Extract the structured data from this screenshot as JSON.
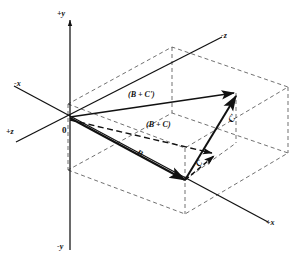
{
  "figure": {
    "background_color": "#ffffff",
    "stroke_color": "#111111",
    "axes": {
      "origin_label": "0",
      "labels": {
        "y_pos": "+y",
        "y_neg": "-y",
        "x_pos": "+x",
        "x_neg": "-x",
        "z_pos": "+z",
        "z_neg": "-z"
      }
    },
    "vectors": [
      {
        "name": "B",
        "label": "B",
        "style": "solid",
        "arrow": "filled"
      },
      {
        "name": "C-prime",
        "label": "C'",
        "style": "solid",
        "arrow": "filled"
      },
      {
        "name": "C",
        "label": "C",
        "style": "dashed",
        "arrow": "filled"
      },
      {
        "name": "B-plus-C-prime",
        "label": "(B + C')",
        "style": "solid",
        "arrow": "filled"
      },
      {
        "name": "B-plus-C",
        "label": "(B + C)",
        "style": "dashed",
        "arrow": "filled"
      }
    ],
    "construction": {
      "box_style": "dashed",
      "box_description": "dashed rectangular parallelepiped projection guides"
    }
  }
}
